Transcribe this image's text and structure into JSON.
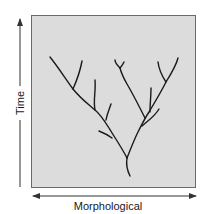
{
  "diagram": {
    "type": "phylogenetic-branching-tree",
    "y_axis": {
      "label": "Time",
      "direction": "up",
      "arrow": "single"
    },
    "x_axis": {
      "label": "Morphological",
      "direction": "both",
      "arrow": "double"
    },
    "colors": {
      "plot_fill": "#dcdcdc",
      "plot_border": "#6a6a6a",
      "branch": "#1a1a1a",
      "axis": "#333333",
      "text": "#1a1a1a"
    }
  }
}
